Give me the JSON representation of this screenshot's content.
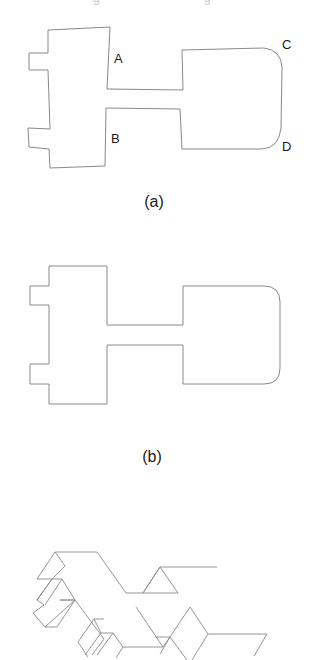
{
  "figure": {
    "top_clipped_text": [
      "g",
      "g"
    ],
    "panel_a": {
      "caption": "(a)",
      "vertex_labels": [
        {
          "id": "A",
          "text": "A"
        },
        {
          "id": "B",
          "text": "B"
        },
        {
          "id": "C",
          "text": "C"
        },
        {
          "id": "D",
          "text": "D"
        }
      ],
      "description": "Hand-sketched 2D outline of a key-shaped part with two left tabs, a neck, and a right block with rounded corners"
    },
    "panel_b": {
      "caption": "(b)",
      "description": "Beautified/rectified 2D outline of the same part"
    },
    "panel_c": {
      "caption": "",
      "description": "Isometric 3D extrusion of the part (clipped at bottom)"
    },
    "colors": {
      "stroke": "#8a8a8a",
      "text": "#1a1a1a",
      "background": "#ffffff"
    }
  }
}
